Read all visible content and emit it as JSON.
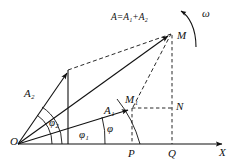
{
  "figure": {
    "type": "vector-phasor-diagram",
    "background_color": "#ffffff",
    "stroke_color": "#111111"
  },
  "labels": {
    "origin": "O",
    "axis_x": "X",
    "omega": "ω",
    "point_M": "M",
    "point_M1": "M₁",
    "point_N": "N",
    "point_P": "P",
    "point_Q": "Q",
    "vector_A1": "A₁",
    "vector_A2": "A₂",
    "resultant": "A=A₁+A₂",
    "angle_phi": "φ",
    "angle_phi1": "φ₁",
    "angle_phi2": "φ₂"
  },
  "geometry": {
    "origin": [
      18,
      144
    ],
    "axis_end": [
      226,
      144
    ],
    "M": [
      172,
      33
    ],
    "M1": [
      132,
      108
    ],
    "N": [
      172,
      108
    ],
    "P": [
      132,
      144
    ],
    "Q": [
      172,
      144
    ],
    "A2_tip": [
      68,
      70
    ],
    "vertical_foot": [
      68,
      144
    ]
  },
  "angles_deg": {
    "phi": 36,
    "phi1": 15,
    "phi2": 57
  }
}
